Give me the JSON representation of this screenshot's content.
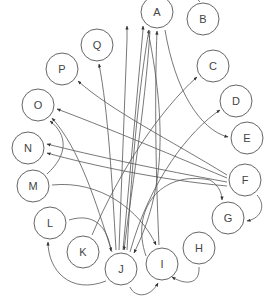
{
  "diagram": {
    "type": "directed-graph",
    "layout": "circular",
    "colors": {
      "node_stroke": "#666666",
      "edge": "#555555",
      "label": "#444444",
      "background": "#ffffff"
    },
    "nodes": [
      {
        "id": "A",
        "label": "A",
        "x": 157,
        "y": 12
      },
      {
        "id": "B",
        "label": "B",
        "x": 203,
        "y": 19
      },
      {
        "id": "C",
        "label": "C",
        "x": 213,
        "y": 66
      },
      {
        "id": "D",
        "label": "D",
        "x": 236,
        "y": 101
      },
      {
        "id": "E",
        "label": "E",
        "x": 247,
        "y": 138
      },
      {
        "id": "F",
        "label": "F",
        "x": 245,
        "y": 180
      },
      {
        "id": "G",
        "label": "G",
        "x": 228,
        "y": 218
      },
      {
        "id": "H",
        "label": "H",
        "x": 199,
        "y": 248
      },
      {
        "id": "I",
        "label": "I",
        "x": 162,
        "y": 264
      },
      {
        "id": "J",
        "label": "J",
        "x": 121,
        "y": 269
      },
      {
        "id": "K",
        "label": "K",
        "x": 83,
        "y": 252
      },
      {
        "id": "L",
        "label": "L",
        "x": 50,
        "y": 223
      },
      {
        "id": "M",
        "label": "M",
        "x": 33,
        "y": 186
      },
      {
        "id": "N",
        "label": "N",
        "x": 28,
        "y": 148
      },
      {
        "id": "O",
        "label": "O",
        "x": 38,
        "y": 105
      },
      {
        "id": "P",
        "label": "P",
        "x": 62,
        "y": 69
      },
      {
        "id": "Q",
        "label": "Q",
        "x": 97,
        "y": 45
      }
    ],
    "edges": [
      {
        "from": "B",
        "to": "A",
        "d": "M 200 2 C 195 -6 180 -4 166 -1"
      },
      {
        "from": "J",
        "to": "Q",
        "d": "M 116 250 C 112 180 108 110 99 64"
      },
      {
        "from": "J",
        "to": "A",
        "d": "M 119 250 L 127 40 L 127 26"
      },
      {
        "from": "J",
        "to": "A",
        "d": "M 123 250 L 143 30 L 143 26"
      },
      {
        "from": "J",
        "to": "A",
        "d": "M 127 250 C 132 160 140 80 149 30"
      },
      {
        "from": "I",
        "to": "A",
        "d": "M 159 245 C 155 160 155 80 157 31"
      },
      {
        "from": "A",
        "to": "E",
        "d": "M 165 30 C 175 90 200 130 228 137"
      },
      {
        "from": "A",
        "to": "J",
        "d": "M 150 31 C 145 110 130 200 124 250"
      },
      {
        "from": "A",
        "to": "J",
        "d": "M 148 31 C 170 140 160 200 134 253"
      },
      {
        "from": "K",
        "to": "C",
        "d": "M 92 235 C 120 170 160 110 197 77"
      },
      {
        "from": "J",
        "to": "D",
        "d": "M 130 252 C 150 180 190 130 220 110"
      },
      {
        "from": "F",
        "to": "P",
        "d": "M 227 175 C 170 140 110 110 78 81"
      },
      {
        "from": "F",
        "to": "O",
        "d": "M 227 178 C 160 150 100 125 57 109"
      },
      {
        "from": "F",
        "to": "N",
        "d": "M 227 182 C 160 170 90 155 47 144"
      },
      {
        "from": "F",
        "to": "N",
        "d": "M 227 186 C 160 180 90 165 47 153"
      },
      {
        "from": "F",
        "to": "G",
        "d": "M 257 195 C 266 205 262 218 247 221"
      },
      {
        "from": "M",
        "to": "O",
        "d": "M 47 174 C 68 155 68 135 50 121"
      },
      {
        "from": "J",
        "to": "O",
        "d": "M 112 252 C 95 200 80 150 52 118"
      },
      {
        "from": "M",
        "to": "I",
        "d": "M 52 185 C 100 180 140 210 156 245"
      },
      {
        "from": "L",
        "to": "J",
        "d": "M 69 220 C 95 212 108 228 111 251"
      },
      {
        "from": "J",
        "to": "L",
        "d": "M 106 281 C 70 295 48 270 48 242"
      },
      {
        "from": "J",
        "to": "I",
        "d": "M 130 287 C 135 298 150 298 158 283"
      },
      {
        "from": "H",
        "to": "I",
        "d": "M 199 267 C 200 285 185 285 172 277"
      },
      {
        "from": "I",
        "to": "G",
        "d": "M 146 256 C 130 210 160 170 210 180 C 220 186 222 195 222 200"
      }
    ]
  }
}
